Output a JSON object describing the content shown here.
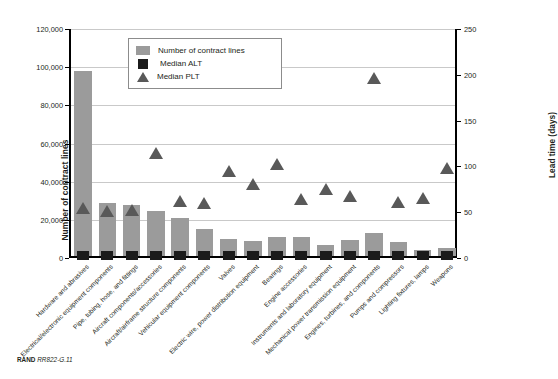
{
  "figure": {
    "footer_brand": "RAND",
    "footer_id": "RR822-G.11"
  },
  "legend": {
    "items": [
      {
        "label": "Number of contract lines",
        "swatch": "bar-swatch"
      },
      {
        "label": "Median ALT",
        "swatch": "square-swatch"
      },
      {
        "label": "Median PLT",
        "swatch": "triangle-swatch"
      }
    ]
  },
  "chart_data": {
    "type": "bar",
    "title": "",
    "xlabel": "",
    "ylabel": "Number of contract lines",
    "y2label": "Lead time (days)",
    "ylim": [
      0,
      120000
    ],
    "y2lim": [
      0,
      250
    ],
    "yticks": [
      "0",
      "20,000",
      "40,000",
      "60,000",
      "80,000",
      "100,000",
      "120,000"
    ],
    "ytick_values": [
      0,
      20000,
      40000,
      60000,
      80000,
      100000,
      120000
    ],
    "y2ticks": [
      "0",
      "50",
      "100",
      "150",
      "200",
      "250"
    ],
    "y2tick_values": [
      0,
      50,
      100,
      150,
      200,
      250
    ],
    "grid": true,
    "legend_position": "upper-center",
    "categories": [
      "Hardware and abrasives",
      "Electrical/electronic equipment components",
      "Pipe, tubing, hose, and fittings",
      "Aircraft components/accessories",
      "Aircraft/airframe structure components",
      "Vehicular equipment components",
      "Valves",
      "Electric wire, power distribution equipment",
      "Bearings",
      "Engine accessories",
      "Instruments and laboratory equipment",
      "Mechanical power transmission equipment",
      "Engines, turbines, and components",
      "Pumps and compressors",
      "Lighting fixtures, lamps",
      "Weapons"
    ],
    "series": [
      {
        "name": "Number of contract lines",
        "axis": "left",
        "values": [
          97000,
          28000,
          27000,
          23500,
          20000,
          14000,
          9000,
          8000,
          10000,
          10200,
          6000,
          8200,
          12000,
          7200,
          3200,
          4200
        ]
      },
      {
        "name": "Median ALT",
        "axis": "right",
        "values": [
          2,
          2,
          2,
          2,
          2,
          2,
          2,
          2,
          2,
          2,
          2,
          2,
          2,
          2,
          2,
          2
        ]
      },
      {
        "name": "Median PLT",
        "axis": "right",
        "values": [
          55,
          51,
          53,
          115,
          62,
          60,
          95,
          81,
          103,
          65,
          75,
          68,
          197,
          61,
          66,
          98
        ]
      }
    ]
  }
}
